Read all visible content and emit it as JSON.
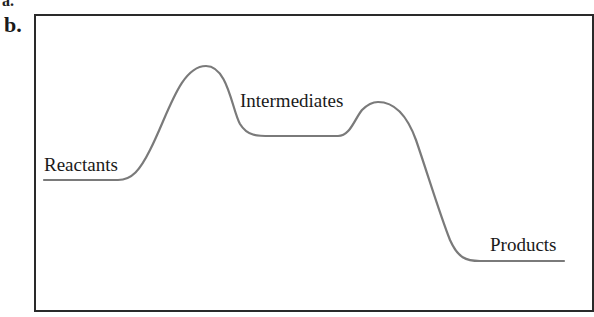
{
  "figure": {
    "panel_label": "b.",
    "prev_panel_fragment": "a.",
    "curve_color": "#7a7a7a",
    "frame_color": "#2a2a2a",
    "labels": {
      "reactants": "Reactants",
      "intermediates": "Intermediates",
      "products": "Products"
    }
  },
  "diagram": {
    "type": "reaction energy profile",
    "stages": [
      "Reactants",
      "Transition state 1",
      "Intermediates",
      "Transition state 2",
      "Products"
    ],
    "relative_levels_px_from_top": {
      "Reactants": 180,
      "Transition state 1": 66,
      "Intermediates": 136,
      "Transition state 2": 102,
      "Products": 261
    }
  }
}
